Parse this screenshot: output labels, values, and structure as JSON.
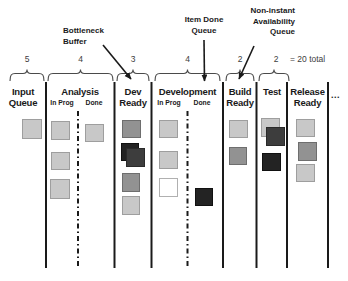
{
  "annotations": {
    "bottleneck": {
      "line1": "Bottleneck",
      "line2": "Buffer"
    },
    "item_done": {
      "line1": "Item Done",
      "line2": "Queue"
    },
    "non_instant": {
      "line1": "Non-instant",
      "line2": "Availability",
      "line3": "Queue"
    }
  },
  "counts": {
    "input": "5",
    "analysis": "4",
    "dev_ready": "3",
    "development": "4",
    "build_ready": "2",
    "test": "2",
    "total": "= 20 total"
  },
  "columns": {
    "input": {
      "line1": "Input",
      "line2": "Queue"
    },
    "analysis": {
      "title": "Analysis",
      "sub1": "In Prog",
      "sub2": "Done"
    },
    "dev_ready": {
      "line1": "Dev",
      "line2": "Ready"
    },
    "development": {
      "title": "Development",
      "sub1": "In Prog",
      "sub2": "Done"
    },
    "build_ready": {
      "line1": "Build",
      "line2": "Ready"
    },
    "test": {
      "title": "Test"
    },
    "release_ready": {
      "line1": "Release",
      "line2": "Ready"
    }
  },
  "ellipsis": "...",
  "palette": {
    "light": {
      "bg": "#c8c8c8",
      "border": "#9e9e9e"
    },
    "medium": {
      "bg": "#929292",
      "border": "#6e6e6e"
    },
    "dark": {
      "bg": "#3d3d3d",
      "border": "#2a2a2a"
    },
    "black": {
      "bg": "#232323",
      "border": "#111111"
    },
    "white": {
      "bg": "#ffffff",
      "border": "#b0b0b0"
    }
  },
  "board": {
    "cards": [
      {
        "column": "input-queue",
        "x": 22,
        "y": 119,
        "w": 20,
        "h": 20,
        "shade": "light"
      },
      {
        "column": "analysis-inprog",
        "x": 51,
        "y": 121,
        "w": 19,
        "h": 19,
        "shade": "light"
      },
      {
        "column": "analysis-inprog",
        "x": 51,
        "y": 152,
        "w": 19,
        "h": 18,
        "shade": "light"
      },
      {
        "column": "analysis-inprog",
        "x": 50,
        "y": 179,
        "w": 20,
        "h": 20,
        "shade": "light"
      },
      {
        "column": "analysis-done",
        "x": 85,
        "y": 124,
        "w": 19,
        "h": 18,
        "shade": "light"
      },
      {
        "column": "dev-ready",
        "x": 122,
        "y": 120,
        "w": 19,
        "h": 18,
        "shade": "medium"
      },
      {
        "column": "dev-ready",
        "x": 121,
        "y": 143,
        "w": 18,
        "h": 18,
        "shade": "black"
      },
      {
        "column": "dev-ready",
        "x": 126,
        "y": 148,
        "w": 19,
        "h": 19,
        "shade": "dark"
      },
      {
        "column": "dev-ready",
        "x": 122,
        "y": 173,
        "w": 18,
        "h": 19,
        "shade": "medium"
      },
      {
        "column": "dev-ready",
        "x": 122,
        "y": 196,
        "w": 18,
        "h": 19,
        "shade": "light"
      },
      {
        "column": "development-inprog",
        "x": 159,
        "y": 120,
        "w": 19,
        "h": 18,
        "shade": "light"
      },
      {
        "column": "development-inprog",
        "x": 159,
        "y": 151,
        "w": 19,
        "h": 18,
        "shade": "light"
      },
      {
        "column": "development-inprog",
        "x": 159,
        "y": 178,
        "w": 19,
        "h": 19,
        "shade": "white"
      },
      {
        "column": "development-done",
        "x": 195,
        "y": 188,
        "w": 18,
        "h": 18,
        "shade": "black"
      },
      {
        "column": "build-ready",
        "x": 229,
        "y": 120,
        "w": 19,
        "h": 18,
        "shade": "light"
      },
      {
        "column": "build-ready",
        "x": 229,
        "y": 147,
        "w": 18,
        "h": 18,
        "shade": "medium"
      },
      {
        "column": "test",
        "x": 261,
        "y": 118,
        "w": 19,
        "h": 19,
        "shade": "light"
      },
      {
        "column": "test",
        "x": 266,
        "y": 127,
        "w": 19,
        "h": 19,
        "shade": "dark"
      },
      {
        "column": "test",
        "x": 262,
        "y": 153,
        "w": 19,
        "h": 18,
        "shade": "black"
      },
      {
        "column": "release-ready",
        "x": 296,
        "y": 119,
        "w": 19,
        "h": 18,
        "shade": "light"
      },
      {
        "column": "release-ready",
        "x": 298,
        "y": 142,
        "w": 19,
        "h": 19,
        "shade": "medium"
      },
      {
        "column": "release-ready",
        "x": 296,
        "y": 164,
        "w": 19,
        "h": 18,
        "shade": "light"
      }
    ]
  }
}
